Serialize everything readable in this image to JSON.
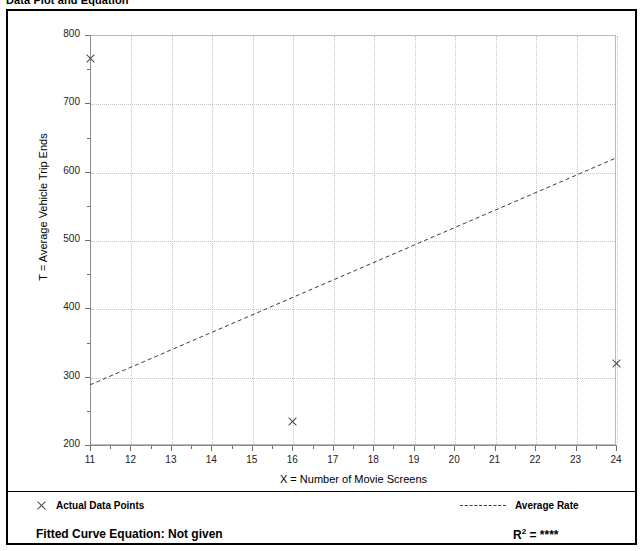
{
  "header": {
    "title": "Data Plot and Equation",
    "right_text": ""
  },
  "legend": {
    "points_label": "Actual Data Points",
    "rate_label": "Average Rate",
    "point_marker_icon": "x-marker-icon",
    "rate_marker_icon": "dashed-line-icon"
  },
  "equation": {
    "label": "Fitted Curve Equation:",
    "value": "Not given",
    "r2_symbol": "R",
    "r2_exponent": "2",
    "r2_equals": "=",
    "r2_value": "****"
  },
  "chart_data": {
    "type": "scatter",
    "title": "Data Plot and Equation",
    "xlabel": "X = Number of Movie Screens",
    "ylabel": "T = Average Vehicle Trip Ends",
    "xlim": [
      11,
      24
    ],
    "ylim": [
      200,
      800
    ],
    "xticks": [
      11,
      12,
      13,
      14,
      15,
      16,
      17,
      18,
      19,
      20,
      21,
      22,
      23,
      24
    ],
    "yticks": [
      200,
      300,
      400,
      500,
      600,
      700,
      800
    ],
    "grid": true,
    "legend_position": "below-plot",
    "series": [
      {
        "name": "Actual Data Points",
        "type": "scatter",
        "marker": "x",
        "color": "#4a4a4a",
        "points": [
          {
            "x": 11,
            "y": 765
          },
          {
            "x": 16,
            "y": 235
          },
          {
            "x": 24,
            "y": 320
          }
        ]
      },
      {
        "name": "Average Rate",
        "type": "line",
        "style": "dashed",
        "color": "#3b3b3b",
        "points": [
          {
            "x": 11,
            "y": 288
          },
          {
            "x": 24,
            "y": 620
          }
        ]
      }
    ]
  }
}
